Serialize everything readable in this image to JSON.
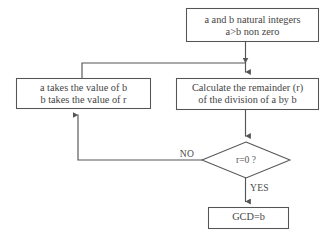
{
  "diagram": {
    "background_color": "#ffffff",
    "stroke_color": "#555555",
    "text_color": "#454545"
  },
  "nodes": {
    "start": {
      "shape": "rectangle",
      "line1": "a and b natural integers",
      "line2": "a>b non zero"
    },
    "assign": {
      "shape": "rectangle",
      "line1": "a takes the value of b",
      "line2": "b takes the value of r"
    },
    "calculate": {
      "shape": "rectangle",
      "line1": "Calculate the remainder (r)",
      "line2": "of the division of a by b"
    },
    "decision": {
      "shape": "diamond",
      "label": "r=0 ?"
    },
    "result": {
      "shape": "rectangle",
      "label": "GCD=b"
    }
  },
  "edges": {
    "no_label": "NO",
    "yes_label": "YES"
  }
}
